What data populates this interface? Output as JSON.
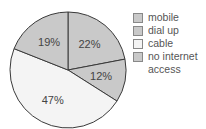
{
  "chart_data": {
    "type": "pie",
    "title": "",
    "categories": [
      "mobile",
      "dial up",
      "cable",
      "no internet access"
    ],
    "values": [
      22,
      12,
      47,
      19
    ],
    "value_labels": [
      "22%",
      "12%",
      "47%",
      "19%"
    ],
    "colors": [
      "#c9c9c9",
      "#c9c9c9",
      "#f4f4f4",
      "#c9c9c9"
    ],
    "start_angle": "12 o'clock",
    "direction": "clockwise",
    "legend_position": "right"
  },
  "legend": {
    "items": [
      {
        "label": "mobile",
        "color": "#c9c9c9"
      },
      {
        "label": "dial up",
        "color": "#c9c9c9"
      },
      {
        "label": "cable",
        "color": "#f4f4f4"
      },
      {
        "label": "no internet\naccess",
        "color": "#c9c9c9"
      }
    ]
  }
}
